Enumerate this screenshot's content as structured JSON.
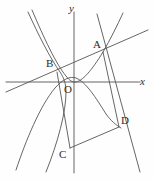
{
  "figure": {
    "background_color": "#fefefe",
    "stroke_color": "#555555",
    "label_color": "#2b2b2b"
  },
  "axes": {
    "x_label": "x",
    "y_label": "y",
    "origin_label": "O",
    "origin_px": {
      "x": 74,
      "y": 82
    },
    "x_axis": {
      "x1": 6,
      "y1": 82,
      "x2": 140,
      "y2": 82
    },
    "y_axis": {
      "x1": 74,
      "y1": 12,
      "x2": 74,
      "y2": 173
    }
  },
  "points": [
    {
      "name": "A",
      "label": "A",
      "x": 103,
      "y": 52,
      "label_dx": -10,
      "label_dy": -13
    },
    {
      "name": "B",
      "label": "B",
      "x": 57,
      "y": 72,
      "label_dx": -11,
      "label_dy": -14
    },
    {
      "name": "C",
      "label": "C",
      "x": 70,
      "y": 148,
      "label_dx": -11,
      "label_dy": 1
    },
    {
      "name": "D",
      "label": "D",
      "x": 119,
      "y": 127,
      "label_dx": 2,
      "label_dy": -12
    },
    {
      "name": "O",
      "label": "O",
      "x": 74,
      "y": 82,
      "label_dx": -10,
      "label_dy": 2
    }
  ],
  "curves": [
    {
      "name": "upward-parabola",
      "type": "quadratic-upward",
      "description": "parabola opening upward with vertex near the origin, passing through B and A",
      "path": "M 32 10 C 44 38, 56 64, 66 76 C 70 81, 72 82, 75 82 C 82 82, 92 70, 103 52 C 110 40, 117 26, 123 13"
    },
    {
      "name": "downward-parabola",
      "type": "quadratic-downward",
      "description": "parabola opening downward passing left of B, through near origin and down to D",
      "path": "M 16 170 C 26 140, 40 106, 55 88 C 63 79, 70 76, 76 78 C 86 82, 96 98, 106 114 C 111 121, 116 125, 121 128"
    },
    {
      "name": "left-descending-branch",
      "type": "curve",
      "description": "curve descending from upper-left toward B then down to lower-left",
      "path": "M 28 12 C 38 34, 50 58, 60 72 C 64 78, 66 84, 66 92 C 66 112, 58 142, 46 172"
    }
  ],
  "lines": [
    {
      "name": "line-through-B-and-A",
      "description": "straight line through B and A extending to both edges",
      "x1": 6,
      "y1": 92,
      "x2": 148,
      "y2": 30
    },
    {
      "name": "segment-B-C",
      "description": "segment from B down to C",
      "x1": 57,
      "y1": 72,
      "x2": 70,
      "y2": 148
    },
    {
      "name": "segment-A-D",
      "description": "segment from A down to D",
      "x1": 103,
      "y1": 52,
      "x2": 119,
      "y2": 127
    },
    {
      "name": "segment-C-D",
      "description": "segment from C to D",
      "x1": 70,
      "y1": 148,
      "x2": 119,
      "y2": 127
    },
    {
      "name": "line-through-A-and-D-extended",
      "description": "line through A and D continuing to lower right",
      "x1": 97,
      "y1": 14,
      "x2": 140,
      "y2": 172
    }
  ]
}
